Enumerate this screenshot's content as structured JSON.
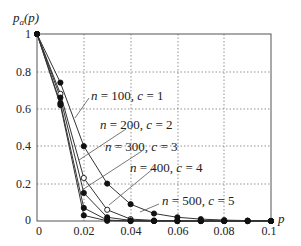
{
  "chart_data": {
    "type": "line",
    "title": "",
    "ylabel": "p_a(p)",
    "xlabel": "p",
    "xlim": [
      0,
      0.1
    ],
    "ylim": [
      0,
      1
    ],
    "x_ticks": [
      "0",
      "0.02",
      "0.04",
      "0.06",
      "0.08",
      "0.1"
    ],
    "y_ticks": [
      "0",
      "0.2",
      "0.4",
      "0.6",
      "0.8",
      "1"
    ],
    "grid": true,
    "x": [
      0,
      0.01,
      0.02,
      0.03,
      0.04,
      0.05,
      0.06,
      0.07,
      0.08,
      0.09,
      0.1
    ],
    "series": [
      {
        "name": "n = 100, c = 1",
        "marker": "filled",
        "values": [
          1,
          0.74,
          0.4,
          0.2,
          0.09,
          0.04,
          0.02,
          0.01,
          0.005,
          0.002,
          0.001
        ]
      },
      {
        "name": "n = 200, c = 2",
        "marker": "open",
        "values": [
          1,
          0.68,
          0.23,
          0.06,
          0.01,
          0.003,
          0.001,
          0,
          0,
          0,
          0
        ]
      },
      {
        "name": "n = 300, c = 3",
        "marker": "filled",
        "values": [
          1,
          0.66,
          0.15,
          0.02,
          0.003,
          0,
          0,
          0,
          0,
          0,
          0
        ]
      },
      {
        "name": "n = 400, c = 4",
        "marker": "filled",
        "values": [
          1,
          0.63,
          0.07,
          0.005,
          0,
          0,
          0,
          0,
          0,
          0,
          0
        ]
      },
      {
        "name": "n = 500, c = 5",
        "marker": "filled",
        "values": [
          1,
          0.62,
          0.03,
          0.001,
          0,
          0,
          0,
          0,
          0,
          0,
          0
        ]
      }
    ],
    "annotations": [
      "n = 100, c = 1",
      "n = 200, c = 2",
      "n = 300, c = 3",
      "n = 400, c = 4",
      "n = 500, c = 5"
    ]
  },
  "labels": {
    "y_axis_main": "p",
    "y_axis_sub": "a",
    "y_axis_arg": "(p)",
    "x_axis": "p",
    "ann": [
      {
        "n": "n",
        "eq1": " = 100, ",
        "c": "c",
        "eq2": " = 1"
      },
      {
        "n": "n",
        "eq1": " = 200, ",
        "c": "c",
        "eq2": " = 2"
      },
      {
        "n": "n",
        "eq1": " = 300, ",
        "c": "c",
        "eq2": " = 3"
      },
      {
        "n": "n",
        "eq1": " = 400, ",
        "c": "c",
        "eq2": " = 4"
      },
      {
        "n": "n",
        "eq1": " = 500, ",
        "c": "c",
        "eq2": " = 5"
      }
    ]
  }
}
